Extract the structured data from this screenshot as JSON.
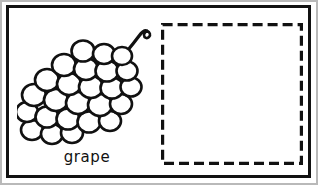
{
  "worksheet": {
    "kind": "picture-word flashcard",
    "background_color": "#ffffff",
    "ink_color": "#111111",
    "frame": {
      "name": "card-outer-frame",
      "border_color": "#111111",
      "border_width_px": 3
    }
  },
  "picture": {
    "subject": "grape",
    "icon_name": "grape-bunch-illustration",
    "style": "black outline line art, uncolored",
    "description": "A bunch of grapes made of overlapping circular berries arranged diagonally, with a curved stem and a small curl at the top right"
  },
  "label": {
    "text": "grape",
    "align": "center"
  },
  "answer_area": {
    "name": "dashed-answer-box",
    "border_style": "dashed",
    "border_color": "#111111",
    "border_width_px": 3,
    "dash_length_px": 10,
    "dash_gap_px": 5,
    "fill": "#ffffff",
    "content": ""
  }
}
